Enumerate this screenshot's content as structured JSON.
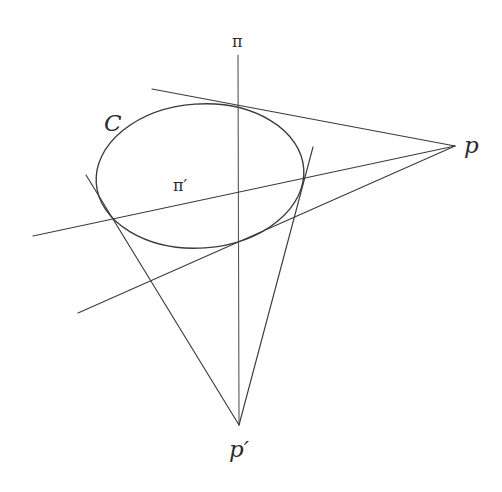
{
  "figure": {
    "background_color": "#ffffff",
    "ink_color": "#3b3b42",
    "width": 502,
    "height": 492,
    "labels": {
      "plane_pi": "π",
      "plane_pi_prime": "π′",
      "pole_p": "p",
      "pole_p_prime": "p′",
      "conic_c": "C"
    }
  },
  "chart_data": {
    "type": "diagram",
    "grid": false,
    "legend": false,
    "xlim": [
      0,
      502
    ],
    "ylim": [
      0,
      492
    ],
    "conic": {
      "name": "C",
      "kind": "ellipse",
      "center": [
        200,
        176
      ],
      "rx": 104,
      "ry": 72,
      "rotation_deg": -4
    },
    "points": [
      {
        "name": "p",
        "label": "p",
        "x": 455,
        "y": 146
      },
      {
        "name": "p'",
        "label": "p′",
        "x": 239,
        "y": 425
      }
    ],
    "lines": [
      {
        "name": "pi",
        "label": "π",
        "role": "vertical-axis-through-p-prime",
        "x1": 238,
        "y1": 55,
        "x2": 239,
        "y2": 425
      },
      {
        "name": "pi-prime",
        "label": "π′",
        "role": "polar-line",
        "x1": 33,
        "y1": 236,
        "x2": 455,
        "y2": 146
      },
      {
        "name": "tangent-p-upper",
        "role": "tangent-from-p-upper",
        "x1": 152,
        "y1": 89,
        "x2": 455,
        "y2": 146,
        "touch_point": [
          219,
          106
        ]
      },
      {
        "name": "tangent-p-lower",
        "role": "tangent-from-p-lower",
        "x1": 78,
        "y1": 313,
        "x2": 455,
        "y2": 146,
        "touch_point": [
          251,
          243
        ]
      },
      {
        "name": "tangent-pprime-left",
        "role": "tangent-from-p-prime-left",
        "x1": 86,
        "y1": 175,
        "x2": 239,
        "y2": 425,
        "touch_point": [
          113,
          222
        ]
      },
      {
        "name": "tangent-pprime-right",
        "role": "tangent-from-p-prime-right",
        "x1": 313,
        "y1": 147,
        "x2": 239,
        "y2": 425,
        "touch_point": [
          303,
          168
        ]
      }
    ]
  }
}
